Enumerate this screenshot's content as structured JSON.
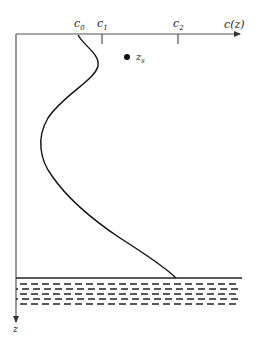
{
  "diagram": {
    "x_axis": {
      "label": "c(z)",
      "ticks": [
        {
          "name": "c0",
          "base": "c",
          "sub": "0",
          "x": 79
        },
        {
          "name": "c1",
          "base": "c",
          "sub": "1",
          "x": 102
        },
        {
          "name": "c2",
          "base": "c",
          "sub": "2",
          "x": 178
        }
      ]
    },
    "y_axis": {
      "label": "z"
    },
    "source": {
      "base": "z",
      "sub": "s"
    },
    "seabed": {
      "description": "sea floor with dashed sediment layers",
      "dash_rows": 5
    },
    "colors": {
      "line": "#111111",
      "axis": "#555555",
      "text": "#222222"
    }
  }
}
